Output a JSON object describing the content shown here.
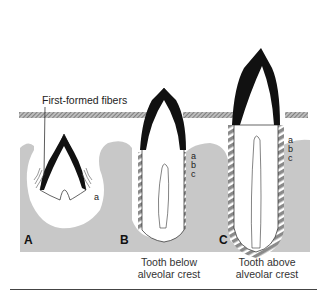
{
  "figure": {
    "callout": "First-formed fibers",
    "panels": [
      {
        "letter": "A",
        "caption_line1": "",
        "caption_line2": "",
        "fiber_label": "a"
      },
      {
        "letter": "B",
        "caption_line1": "Tooth below",
        "caption_line2": "alveolar crest",
        "fiber_labels": [
          "a",
          "b",
          "c"
        ]
      },
      {
        "letter": "C",
        "caption_line1": "Tooth above",
        "caption_line2": "alveolar crest",
        "fiber_labels": [
          "a",
          "b",
          "c"
        ]
      }
    ],
    "colors": {
      "bone": "#c8c8c8",
      "gingiva": "#9a9a9a",
      "enamel": "#111111",
      "fiber": "#8a8a8a"
    }
  }
}
